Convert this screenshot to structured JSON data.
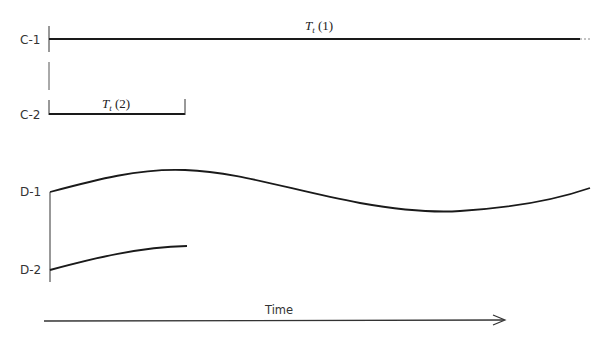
{
  "diagram": {
    "rows": [
      {
        "id": "C-1",
        "label": "C-1",
        "type": "constant",
        "annotation_var": "T",
        "annotation_sub": "t",
        "annotation_arg": " (1)"
      },
      {
        "id": "C-2",
        "label": "C-2",
        "type": "constant",
        "annotation_var": "T",
        "annotation_sub": "t",
        "annotation_arg": " (2)"
      },
      {
        "id": "D-1",
        "label": "D-1",
        "type": "variable"
      },
      {
        "id": "D-2",
        "label": "D-2",
        "type": "variable"
      }
    ],
    "x_axis": {
      "label": "Time",
      "direction": "right-arrow"
    },
    "colors": {
      "line": "#1a1a1a",
      "text": "#333333",
      "background": "#ffffff"
    }
  }
}
